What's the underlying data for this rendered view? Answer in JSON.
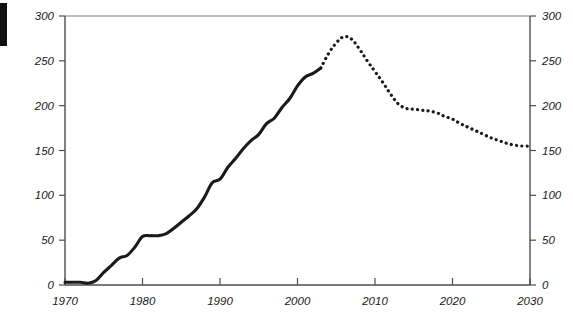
{
  "figure": {
    "edge_marker": {
      "name": "left-edge-black-bar",
      "color": "#111111"
    },
    "background_color": "#ffffff",
    "line_color": "#1a1a1a",
    "axis_color": "#4d4d4d"
  },
  "chart_data": {
    "type": "line",
    "title": "",
    "subtitle": "",
    "xlabel": "",
    "ylabel": "",
    "xlim": [
      1970,
      2030
    ],
    "ylim": [
      0,
      300
    ],
    "grid": false,
    "legend": null,
    "x_ticks": [
      1970,
      1980,
      1990,
      2000,
      2010,
      2020,
      2030
    ],
    "x_tick_labels": [
      "1970",
      "1980",
      "1990",
      "2000",
      "2010",
      "2020",
      "2030"
    ],
    "y_ticks": [
      0,
      50,
      100,
      150,
      200,
      250,
      300
    ],
    "y_tick_labels_left": [
      "0",
      "50",
      "100",
      "150",
      "200",
      "250",
      "300"
    ],
    "y_tick_labels_right": [
      "0",
      "50",
      "100",
      "150",
      "200",
      "250",
      "300"
    ],
    "axis_left_label_position": "outside-left",
    "axis_right_label_position": "outside-right",
    "series": [
      {
        "name": "historical",
        "style": "solid",
        "x": [
          1970,
          1971,
          1972,
          1973,
          1974,
          1975,
          1976,
          1977,
          1978,
          1979,
          1980,
          1981,
          1982,
          1983,
          1984,
          1985,
          1986,
          1987,
          1988,
          1989,
          1990,
          1991,
          1992,
          1993,
          1994,
          1995,
          1996,
          1997,
          1998,
          1999,
          2000,
          2001,
          2002,
          2003
        ],
        "values": [
          3,
          3,
          3,
          2,
          5,
          14,
          22,
          30,
          33,
          42,
          54,
          55,
          55,
          57,
          63,
          70,
          77,
          85,
          98,
          114,
          118,
          131,
          141,
          152,
          161,
          168,
          180,
          186,
          198,
          208,
          222,
          232,
          236,
          242
        ],
        "y_unit": ""
      },
      {
        "name": "projection",
        "style": "dotted",
        "x": [
          2003,
          2004,
          2005,
          2006,
          2007,
          2008,
          2009,
          2010,
          2011,
          2012,
          2013,
          2014,
          2015,
          2016,
          2017,
          2018,
          2019,
          2020,
          2021,
          2022,
          2023,
          2024,
          2025,
          2026,
          2027,
          2028,
          2029,
          2030
        ],
        "values": [
          242,
          258,
          270,
          277,
          274,
          263,
          250,
          238,
          226,
          213,
          202,
          197,
          196,
          195,
          194,
          192,
          188,
          185,
          180,
          176,
          172,
          168,
          164,
          161,
          158,
          156,
          155,
          155
        ],
        "y_unit": ""
      }
    ],
    "annotations": []
  }
}
